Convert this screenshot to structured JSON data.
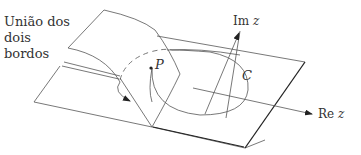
{
  "figure": {
    "caption_lines": [
      "União dos",
      "dois",
      "bordos"
    ],
    "point_label": "P",
    "contour_label": "C",
    "axis_imag": {
      "prefix": "Im",
      "var": "z"
    },
    "axis_real": {
      "prefix": "Re",
      "var": "z"
    },
    "colors": {
      "stroke": "#555555",
      "edge_dark": "#222222",
      "text": "#333333",
      "background": "#ffffff"
    }
  }
}
